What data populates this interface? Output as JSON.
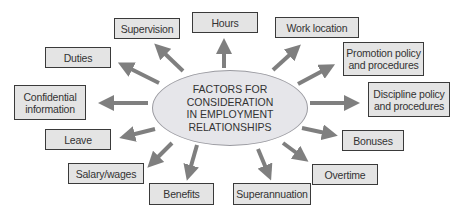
{
  "diagram": {
    "center_label": "FACTORS FOR CONSIDERATION IN EMPLOYMENT RELATIONSHIPS",
    "center_lines": [
      "FACTORS FOR",
      "CONSIDERATION",
      "IN EMPLOYMENT",
      "RELATIONSHIPS"
    ],
    "colors": {
      "box_fill": "#e4e4e4",
      "box_border": "#3a3a3a",
      "arrow": "#7f7f7f",
      "ellipse_fill": "#e6e6ea"
    },
    "factors": [
      {
        "id": "hours",
        "lines": [
          "Hours"
        ]
      },
      {
        "id": "work-location",
        "lines": [
          "Work location"
        ]
      },
      {
        "id": "promotion",
        "lines": [
          "Promotion policy",
          "and procedures"
        ]
      },
      {
        "id": "discipline",
        "lines": [
          "Discipline policy",
          "and procedures"
        ]
      },
      {
        "id": "bonuses",
        "lines": [
          "Bonuses"
        ]
      },
      {
        "id": "overtime",
        "lines": [
          "Overtime"
        ]
      },
      {
        "id": "superannuation",
        "lines": [
          "Superannuation"
        ]
      },
      {
        "id": "benefits",
        "lines": [
          "Benefits"
        ]
      },
      {
        "id": "salary",
        "lines": [
          "Salary/wages"
        ]
      },
      {
        "id": "leave",
        "lines": [
          "Leave"
        ]
      },
      {
        "id": "confidential",
        "lines": [
          "Confidential",
          "information"
        ]
      },
      {
        "id": "duties",
        "lines": [
          "Duties"
        ]
      },
      {
        "id": "supervision",
        "lines": [
          "Supervision"
        ]
      }
    ]
  }
}
